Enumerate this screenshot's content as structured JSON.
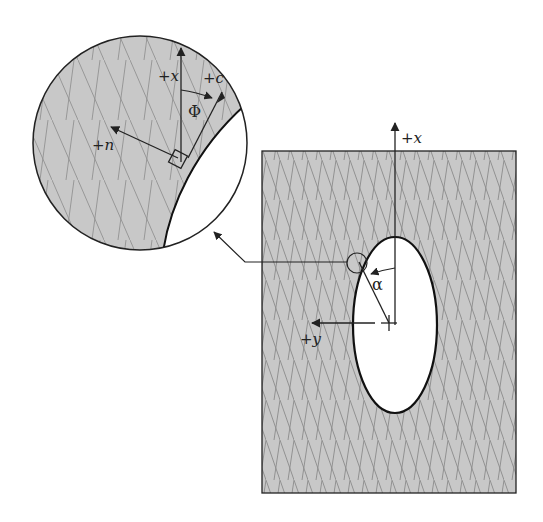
{
  "figure": {
    "type": "engineering-diagram",
    "colors": {
      "fill": "#c8c8c8",
      "hatch": "#8a8a8a",
      "stroke": "#222222",
      "hole": "#ffffff"
    },
    "main_view": {
      "axis_x_label": "+x",
      "axis_y_label": "+y",
      "angle_label": "α"
    },
    "detail_view": {
      "axis_x_label": "+x",
      "axis_c_label": "+c",
      "axis_n_label": "+n",
      "angle_label": "Φ"
    }
  }
}
